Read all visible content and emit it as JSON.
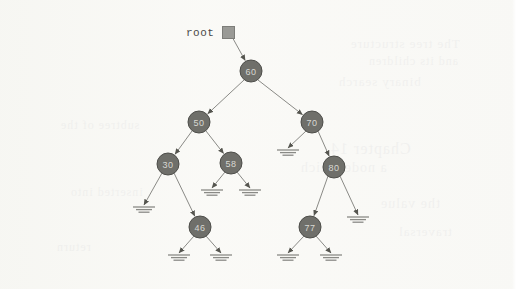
{
  "figure": {
    "kind": "binary-search-tree-diagram",
    "background_color": "#faf9f6",
    "node_fill": "#6f6f6a",
    "node_stroke": "#4e4e4a",
    "node_text_color": "#d8d8d2",
    "edge_color": "#8a8a86",
    "null_marker_color": "#8a8a86"
  },
  "root_pointer": {
    "label": "root",
    "label_x": 186,
    "label_y": 27,
    "box_x": 222,
    "box_y": 26,
    "target_node": "60"
  },
  "nodes": [
    {
      "id": "n60",
      "value": "60",
      "cx": 251,
      "cy": 71,
      "r": 11
    },
    {
      "id": "n50",
      "value": "50",
      "cx": 199,
      "cy": 122,
      "r": 11
    },
    {
      "id": "n70",
      "value": "70",
      "cx": 312,
      "cy": 122,
      "r": 11
    },
    {
      "id": "n30",
      "value": "30",
      "cx": 168,
      "cy": 164,
      "r": 11
    },
    {
      "id": "n58",
      "value": "58",
      "cx": 231,
      "cy": 163,
      "r": 11
    },
    {
      "id": "n80",
      "value": "80",
      "cx": 334,
      "cy": 167,
      "r": 11
    },
    {
      "id": "n46",
      "value": "46",
      "cx": 200,
      "cy": 227,
      "r": 11
    },
    {
      "id": "n77",
      "value": "77",
      "cx": 310,
      "cy": 227,
      "r": 11
    }
  ],
  "edges": [
    {
      "from": "n60",
      "to": "n50",
      "x1": 244,
      "y1": 80,
      "x2": 205,
      "y2": 113
    },
    {
      "from": "n60",
      "to": "n70",
      "x1": 258,
      "y1": 80,
      "x2": 306,
      "y2": 113
    },
    {
      "from": "n50",
      "to": "n30",
      "x1": 192,
      "y1": 131,
      "x2": 173,
      "y2": 155
    },
    {
      "from": "n50",
      "to": "n58",
      "x1": 206,
      "y1": 131,
      "x2": 226,
      "y2": 154
    },
    {
      "from": "n70",
      "to": "n80",
      "x1": 318,
      "y1": 131,
      "x2": 329,
      "y2": 158
    },
    {
      "from": "n30",
      "to": "n46",
      "x1": 174,
      "y1": 173,
      "x2": 195,
      "y2": 218
    },
    {
      "from": "n80",
      "to": "n77",
      "x1": 328,
      "y1": 176,
      "x2": 315,
      "y2": 218
    }
  ],
  "null_edges": [
    {
      "parent": "n70",
      "side": "left",
      "x1": 306,
      "y1": 131,
      "x2": 288,
      "y2": 148
    },
    {
      "parent": "n30",
      "side": "left",
      "x1": 162,
      "y1": 173,
      "x2": 144,
      "y2": 205
    },
    {
      "parent": "n58",
      "side": "left",
      "x1": 225,
      "y1": 172,
      "x2": 212,
      "y2": 188
    },
    {
      "parent": "n58",
      "side": "right",
      "x1": 237,
      "y1": 172,
      "x2": 250,
      "y2": 188
    },
    {
      "parent": "n80",
      "side": "right",
      "x1": 340,
      "y1": 176,
      "x2": 358,
      "y2": 215
    },
    {
      "parent": "n46",
      "side": "left",
      "x1": 194,
      "y1": 236,
      "x2": 179,
      "y2": 253
    },
    {
      "parent": "n46",
      "side": "right",
      "x1": 206,
      "y1": 236,
      "x2": 221,
      "y2": 253
    },
    {
      "parent": "n77",
      "side": "left",
      "x1": 304,
      "y1": 236,
      "x2": 288,
      "y2": 253
    },
    {
      "parent": "n77",
      "side": "right",
      "x1": 316,
      "y1": 236,
      "x2": 331,
      "y2": 253
    }
  ],
  "null_markers": [
    {
      "id": "nm1",
      "x": 288,
      "y": 150
    },
    {
      "id": "nm2",
      "x": 144,
      "y": 207
    },
    {
      "id": "nm3",
      "x": 212,
      "y": 190
    },
    {
      "id": "nm4",
      "x": 250,
      "y": 190
    },
    {
      "id": "nm5",
      "x": 358,
      "y": 217
    },
    {
      "id": "nm6",
      "x": 179,
      "y": 255
    },
    {
      "id": "nm7",
      "x": 221,
      "y": 255
    },
    {
      "id": "nm8",
      "x": 288,
      "y": 255
    },
    {
      "id": "nm9",
      "x": 331,
      "y": 255
    }
  ],
  "bleed_text": [
    {
      "text": "The tree structure",
      "x": 350,
      "y": 36,
      "size": 13
    },
    {
      "text": "and its children",
      "x": 368,
      "y": 54,
      "size": 12
    },
    {
      "text": "binary search",
      "x": 338,
      "y": 74,
      "size": 13
    },
    {
      "text": "Chapter 14",
      "x": 330,
      "y": 140,
      "size": 16
    },
    {
      "text": "a node which",
      "x": 300,
      "y": 160,
      "size": 14
    },
    {
      "text": "subtree of the",
      "x": 60,
      "y": 118,
      "size": 12
    },
    {
      "text": "inserted into",
      "x": 70,
      "y": 185,
      "size": 12
    },
    {
      "text": "the value",
      "x": 380,
      "y": 196,
      "size": 14
    },
    {
      "text": "traversal",
      "x": 398,
      "y": 224,
      "size": 13
    },
    {
      "text": "return",
      "x": 56,
      "y": 240,
      "size": 12
    }
  ]
}
